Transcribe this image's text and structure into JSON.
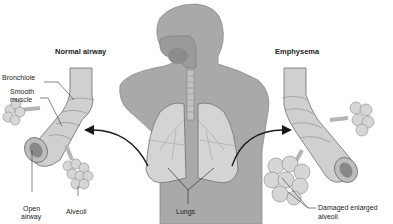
{
  "diagram": {
    "panels": {
      "left": {
        "title": "Normal airway"
      },
      "right": {
        "title": "Emphysema"
      }
    },
    "labels": {
      "bronchiole": "Bronchiole",
      "smooth_muscle_1": "Smooth",
      "smooth_muscle_2": "muscle",
      "open_airway_1": "Open",
      "open_airway_2": "airway",
      "alveoli": "Alveoli",
      "lungs": "Lungs",
      "damaged_1": "Damaged enlarged",
      "damaged_2": "alveoli"
    },
    "colors": {
      "body_fill": "#a9a9a9",
      "lung_fill": "#d4d4d4",
      "airway_fill": "#d0d0d0",
      "outline": "#6e6e6e",
      "arrow": "#1a1a1a",
      "background": "#ffffff"
    }
  }
}
